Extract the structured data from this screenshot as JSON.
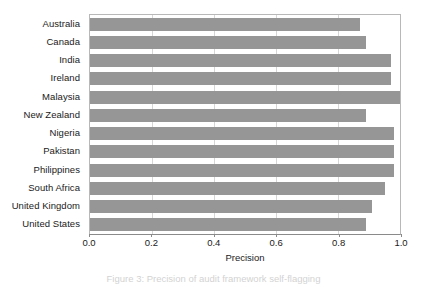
{
  "chart_data": {
    "type": "bar",
    "orientation": "horizontal",
    "title": "",
    "xlabel": "Precision",
    "ylabel": "",
    "xlim": [
      0.0,
      1.0
    ],
    "xticks": [
      "0.0",
      "0.2",
      "0.4",
      "0.6",
      "0.8",
      "1.0"
    ],
    "xtick_values": [
      0.0,
      0.2,
      0.4,
      0.6,
      0.8,
      1.0
    ],
    "grid": "vertical",
    "legend": null,
    "bar_color": "#969696",
    "categories": [
      "Australia",
      "Canada",
      "India",
      "Ireland",
      "Malaysia",
      "New Zealand",
      "Nigeria",
      "Pakistan",
      "Philippines",
      "South Africa",
      "United Kingdom",
      "United States"
    ],
    "values": [
      0.87,
      0.89,
      0.97,
      0.97,
      1.0,
      0.89,
      0.98,
      0.98,
      0.98,
      0.95,
      0.91,
      0.89
    ]
  },
  "caption": {
    "text": "Figure 3: Precision of audit framework self-flagging"
  }
}
